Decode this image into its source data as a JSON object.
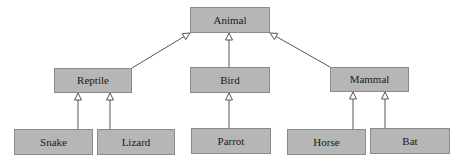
{
  "diagram": {
    "type": "class-hierarchy",
    "fill_color": "#b6b6b6",
    "border_color": "#8a8a8a",
    "edge_color": "#555555",
    "nodes": [
      {
        "id": "animal",
        "label": "Animal",
        "x": 190,
        "y": 7,
        "w": 80,
        "h": 26
      },
      {
        "id": "reptile",
        "label": "Reptile",
        "x": 54,
        "y": 68,
        "w": 78,
        "h": 25
      },
      {
        "id": "bird",
        "label": "Bird",
        "x": 190,
        "y": 67,
        "w": 80,
        "h": 26
      },
      {
        "id": "mammal",
        "label": "Mammal",
        "x": 330,
        "y": 67,
        "w": 79,
        "h": 25
      },
      {
        "id": "snake",
        "label": "Snake",
        "x": 14,
        "y": 129,
        "w": 79,
        "h": 26
      },
      {
        "id": "lizard",
        "label": "Lizard",
        "x": 97,
        "y": 129,
        "w": 78,
        "h": 26
      },
      {
        "id": "parrot",
        "label": "Parrot",
        "x": 191,
        "y": 128,
        "w": 80,
        "h": 26
      },
      {
        "id": "horse",
        "label": "Horse",
        "x": 287,
        "y": 129,
        "w": 79,
        "h": 26
      },
      {
        "id": "bat",
        "label": "Bat",
        "x": 370,
        "y": 128,
        "w": 80,
        "h": 26
      }
    ],
    "edges": [
      {
        "from": "reptile",
        "to": "animal",
        "x1": 132,
        "y1": 68,
        "x2": 190,
        "y2": 33,
        "arrow": "hollow-triangle"
      },
      {
        "from": "bird",
        "to": "animal",
        "x1": 229,
        "y1": 67,
        "x2": 229,
        "y2": 33,
        "arrow": "hollow-triangle"
      },
      {
        "from": "mammal",
        "to": "animal",
        "x1": 330,
        "y1": 67,
        "x2": 270,
        "y2": 33,
        "arrow": "hollow-triangle"
      },
      {
        "from": "snake",
        "to": "reptile",
        "x1": 78,
        "y1": 129,
        "x2": 78,
        "y2": 93,
        "arrow": "hollow-triangle"
      },
      {
        "from": "lizard",
        "to": "reptile",
        "x1": 110,
        "y1": 129,
        "x2": 110,
        "y2": 93,
        "arrow": "hollow-triangle"
      },
      {
        "from": "parrot",
        "to": "bird",
        "x1": 229,
        "y1": 128,
        "x2": 229,
        "y2": 93,
        "arrow": "hollow-triangle"
      },
      {
        "from": "horse",
        "to": "mammal",
        "x1": 353,
        "y1": 129,
        "x2": 353,
        "y2": 92,
        "arrow": "hollow-triangle"
      },
      {
        "from": "bat",
        "to": "mammal",
        "x1": 385,
        "y1": 128,
        "x2": 385,
        "y2": 92,
        "arrow": "hollow-triangle"
      }
    ]
  }
}
